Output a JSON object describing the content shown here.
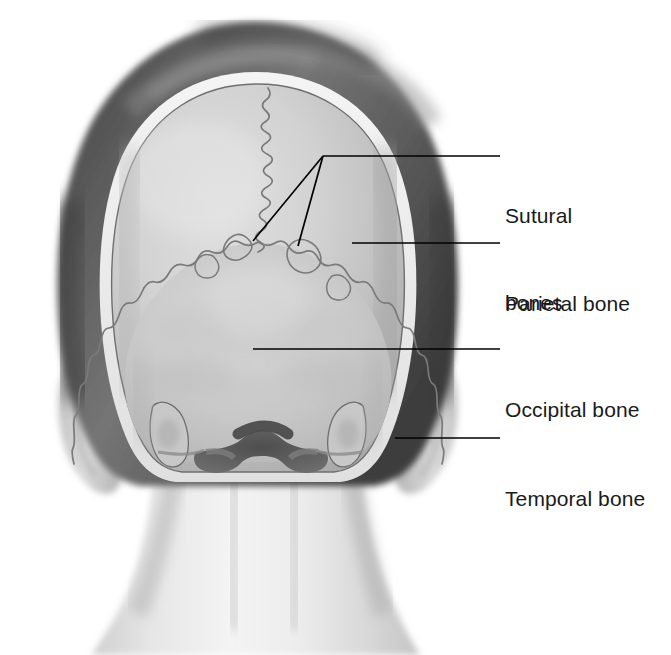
{
  "figure": {
    "view": "posterior",
    "background_color": "#ffffff",
    "width": 671,
    "height": 655
  },
  "palette": {
    "hair_dark": "#4a4a4a",
    "hair_mid": "#6e6e6e",
    "hair_light": "#8c8c8c",
    "scalp_rim": "#ededed",
    "skull_light": "#d8d8d8",
    "skull_mid": "#c4c4c4",
    "skull_shadow": "#a8a8a8",
    "skin_light": "#f2f2f2",
    "skin_mid": "#dcdcdc",
    "skin_shadow": "#bfbfbf",
    "suture_line": "#6b6b6b",
    "outline": "#555555",
    "foramen_dark": "#585858",
    "leader_line": "#000000",
    "label_text": "#1a1a1a"
  },
  "labels": [
    {
      "id": "sutural-bones",
      "lines": [
        "Sutural",
        "bones"
      ],
      "text_x": 505,
      "text_y": 143,
      "leader": {
        "type": "forked",
        "elbow": [
          323,
          156
        ],
        "line_end": [
          500,
          156
        ],
        "branches": [
          [
            253,
            241
          ],
          [
            298,
            246
          ]
        ]
      }
    },
    {
      "id": "parietal-bone",
      "lines": [
        "Parietal bone"
      ],
      "text_x": 505,
      "text_y": 231,
      "leader": {
        "type": "straight",
        "start": [
          352,
          243
        ],
        "line_end": [
          500,
          243
        ]
      }
    },
    {
      "id": "occipital-bone",
      "lines": [
        "Occipital bone"
      ],
      "text_x": 505,
      "text_y": 337,
      "leader": {
        "type": "straight",
        "start": [
          253,
          349
        ],
        "line_end": [
          500,
          349
        ]
      }
    },
    {
      "id": "temporal-bone",
      "lines": [
        "Temporal bone"
      ],
      "text_x": 505,
      "text_y": 426,
      "leader": {
        "type": "straight",
        "start": [
          395,
          438
        ],
        "line_end": [
          500,
          438
        ]
      }
    }
  ],
  "structures": [
    {
      "id": "hair",
      "name": "hair"
    },
    {
      "id": "scalp",
      "name": "scalp-rim"
    },
    {
      "id": "parietal-bone-region",
      "name": "parietal-bone"
    },
    {
      "id": "occipital-bone-region",
      "name": "occipital-bone"
    },
    {
      "id": "temporal-bone-region",
      "name": "temporal-bone"
    },
    {
      "id": "sagittal-suture",
      "name": "sagittal-suture"
    },
    {
      "id": "lambdoid-suture",
      "name": "lambdoid-suture"
    },
    {
      "id": "sutural-bone-wormian",
      "name": "sutural-bones"
    },
    {
      "id": "foramen-magnum",
      "name": "foramen-magnum"
    },
    {
      "id": "mastoid-process-left",
      "name": "mastoid-process"
    },
    {
      "id": "mastoid-process-right",
      "name": "mastoid-process"
    },
    {
      "id": "ear-left",
      "name": "ear"
    },
    {
      "id": "ear-right",
      "name": "ear"
    },
    {
      "id": "neck",
      "name": "neck"
    }
  ]
}
